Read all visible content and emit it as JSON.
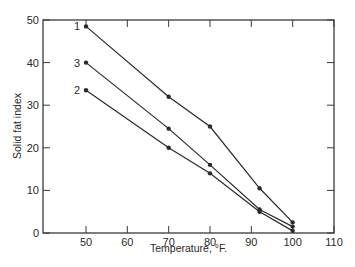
{
  "chart_data": {
    "type": "line",
    "title": "",
    "xlabel": "Temperature, °F.",
    "ylabel": "Solid fat index",
    "xlim": [
      40,
      110
    ],
    "ylim": [
      0,
      50
    ],
    "x_ticks": [
      50,
      60,
      70,
      80,
      90,
      100,
      110
    ],
    "y_ticks": [
      0,
      10,
      20,
      30,
      40,
      50
    ],
    "grid": false,
    "legend": "inline labels at left end of each curve",
    "series": [
      {
        "name": "1",
        "x": [
          50,
          70,
          80,
          92,
          100
        ],
        "y": [
          48.5,
          32,
          25,
          10.5,
          2.5
        ]
      },
      {
        "name": "3",
        "x": [
          50,
          70,
          80,
          92,
          100
        ],
        "y": [
          40,
          24.5,
          16,
          5.5,
          1.5
        ]
      },
      {
        "name": "2",
        "x": [
          50,
          70,
          80,
          92,
          100
        ],
        "y": [
          33.5,
          20,
          14,
          5,
          0.5
        ]
      }
    ]
  },
  "colors": {
    "line": "#2a2a2a",
    "axis": "#3a3a3a"
  }
}
